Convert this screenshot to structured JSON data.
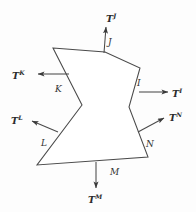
{
  "figure": {
    "background_color": "#fdfdfd",
    "stroke_color": "#4a4a4a",
    "text_color": "#2b2b2b"
  },
  "body": {
    "name": "irregular-polygon",
    "vertices": [
      [
        53,
        48
      ],
      [
        105,
        52
      ],
      [
        140,
        68
      ],
      [
        129,
        107
      ],
      [
        148,
        157
      ],
      [
        37,
        165
      ],
      [
        82,
        105
      ]
    ],
    "fill": "#ffffff"
  },
  "edges": [
    {
      "id": "J",
      "label": "J",
      "label_x": 108,
      "label_y": 38
    },
    {
      "id": "I",
      "label": "I",
      "label_x": 137,
      "label_y": 79
    },
    {
      "id": "N",
      "label": "N",
      "label_x": 146,
      "label_y": 140
    },
    {
      "id": "M",
      "label": "M",
      "label_x": 110,
      "label_y": 168
    },
    {
      "id": "L",
      "label": "L",
      "label_x": 41,
      "label_y": 139
    },
    {
      "id": "K",
      "label": "K",
      "label_x": 55,
      "label_y": 85
    }
  ],
  "tractions": [
    {
      "id": "T-J",
      "base": "T",
      "superscript": "J",
      "arrow": {
        "x1": 104,
        "y1": 53,
        "x2": 106,
        "y2": 27
      },
      "label_x": 106,
      "label_y": 13
    },
    {
      "id": "T-I",
      "base": "T",
      "superscript": "I",
      "arrow": {
        "x1": 139,
        "y1": 92,
        "x2": 168,
        "y2": 92
      },
      "label_x": 172,
      "label_y": 88
    },
    {
      "id": "T-N",
      "base": "T",
      "superscript": "N",
      "arrow": {
        "x1": 138,
        "y1": 132,
        "x2": 164,
        "y2": 118
      },
      "label_x": 169,
      "label_y": 112
    },
    {
      "id": "T-M",
      "base": "T",
      "superscript": "M",
      "arrow": {
        "x1": 96,
        "y1": 162,
        "x2": 96,
        "y2": 188
      },
      "label_x": 88,
      "label_y": 194
    },
    {
      "id": "T-L",
      "base": "T",
      "superscript": "L",
      "arrow": {
        "x1": 58,
        "y1": 132,
        "x2": 32,
        "y2": 121
      },
      "label_x": 11,
      "label_y": 115
    },
    {
      "id": "T-K",
      "base": "T",
      "superscript": "K",
      "arrow": {
        "x1": 69,
        "y1": 74,
        "x2": 38,
        "y2": 74
      },
      "label_x": 12,
      "label_y": 70
    }
  ]
}
